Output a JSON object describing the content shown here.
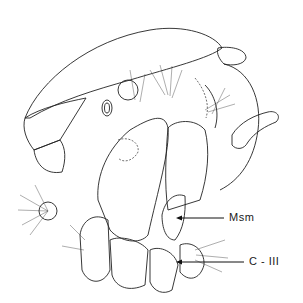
{
  "figure": {
    "labels": [
      {
        "id": "msm",
        "text": "Msm"
      },
      {
        "id": "c3",
        "text": "C - III"
      }
    ],
    "colors": {
      "ink": "#222222",
      "background": "#ffffff"
    }
  }
}
